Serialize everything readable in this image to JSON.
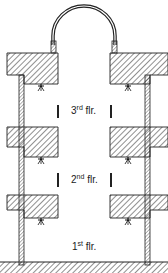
{
  "diagram": {
    "type": "building-section",
    "floors": [
      {
        "id": "floor-3",
        "number": "3",
        "suffix": "rd",
        "abbr": "flr."
      },
      {
        "id": "floor-2",
        "number": "2",
        "suffix": "nd",
        "abbr": "flr."
      },
      {
        "id": "floor-1",
        "number": "1",
        "suffix": "st",
        "abbr": "flr."
      }
    ],
    "symbols": {
      "sprinkler": "sprinkler-icon",
      "opening_marker": "vertical-bar-marker"
    },
    "colors": {
      "line": "#222222",
      "hatch": "#333333",
      "background": "#ffffff"
    }
  }
}
